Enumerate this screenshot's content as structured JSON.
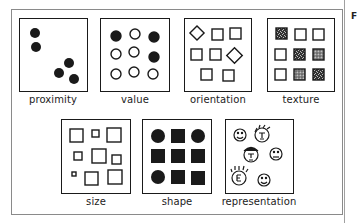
{
  "figure": {
    "panels": [
      {
        "id": "proximity",
        "label": "proximity"
      },
      {
        "id": "value",
        "label": "value"
      },
      {
        "id": "orientation",
        "label": "orientation"
      },
      {
        "id": "texture",
        "label": "texture"
      },
      {
        "id": "size",
        "label": "size"
      },
      {
        "id": "shape",
        "label": "shape"
      },
      {
        "id": "representation",
        "label": "representation"
      }
    ],
    "side_text": "F",
    "colors": {
      "ink": "#1a1a1a",
      "frame": "#8a8a8a",
      "background": "#ffffff"
    }
  }
}
